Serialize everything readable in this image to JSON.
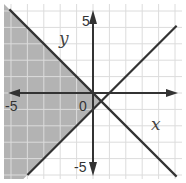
{
  "chart_data": {
    "type": "line",
    "title": "",
    "xlabel": "x",
    "ylabel": "y",
    "xlim": [
      -5.5,
      5.5
    ],
    "ylim": [
      -5.5,
      5.5
    ],
    "grid": true,
    "tick_labels": {
      "x_neg": "-5",
      "y_pos": "5",
      "y_neg": "-5",
      "origin": "0"
    },
    "series": [
      {
        "name": "y = -x",
        "slope": -1,
        "intercept": 0,
        "style": "solid"
      },
      {
        "name": "y = x - 1",
        "slope": 1,
        "intercept": -1,
        "style": "solid"
      }
    ],
    "shaded_region": {
      "description": "y <= -x and y >= x - 1 (region to the left of both lines)",
      "color": "#b3b3b3"
    },
    "colors": {
      "line": "#333333",
      "grid": "#dcdcdc",
      "shade": "#b3b3b3",
      "axis": "#333333"
    }
  }
}
